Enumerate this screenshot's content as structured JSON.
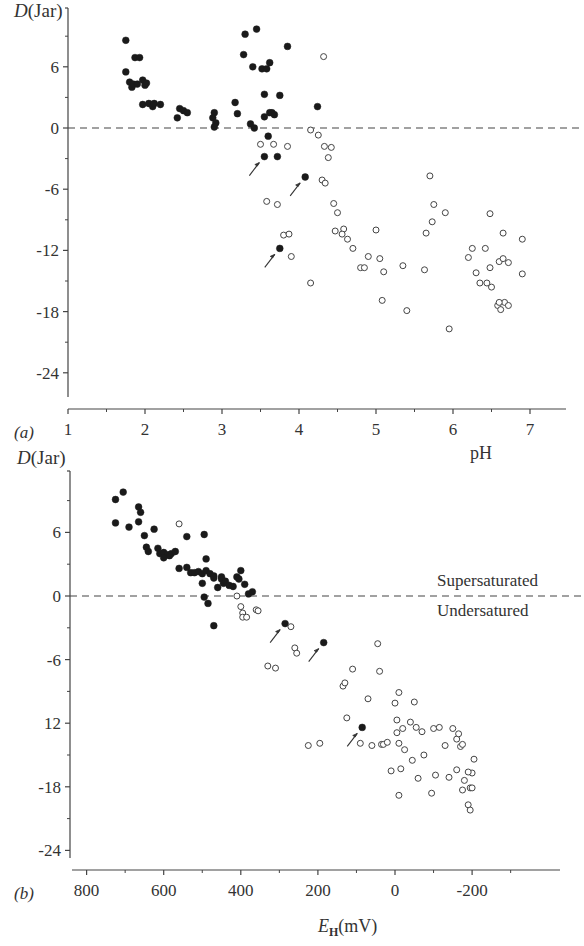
{
  "figure": {
    "panels": [
      {
        "id": "a",
        "panel_label": "(a)",
        "y_label_italic": "D",
        "y_label_rest": "(Jar)",
        "x_label": "pH",
        "y_tick_labels": [
          "6",
          "0",
          "-6",
          "-12",
          "-18",
          "-24"
        ],
        "x_tick_labels": [
          "1",
          "2",
          "3",
          "4",
          "5",
          "6",
          "7"
        ]
      },
      {
        "id": "b",
        "panel_label": "(b)",
        "y_label_italic": "D",
        "y_label_rest": "(Jar)",
        "x_label_italic": "E",
        "x_label_sub": "H",
        "x_label_rest": "(mV)",
        "y_tick_labels": [
          "6",
          "0",
          "-6",
          "12",
          "-18",
          "-24"
        ],
        "x_tick_labels": [
          "800",
          "600",
          "400",
          "200",
          "0",
          "-200"
        ],
        "annotation_above": "Supersaturated",
        "annotation_below": "Undersatured"
      }
    ]
  },
  "chart_data": [
    {
      "type": "scatter",
      "title": "",
      "panel": "(a)",
      "xlabel": "pH",
      "ylabel": "D (Jar)",
      "xlim": [
        1,
        7.5
      ],
      "ylim": [
        -27,
        10
      ],
      "xticks": [
        1,
        2,
        3,
        4,
        5,
        6,
        7
      ],
      "yticks": [
        6,
        0,
        -6,
        -12,
        -18,
        -24
      ],
      "reference_line": {
        "y": 0,
        "style": "dashed"
      },
      "grid": false,
      "series": [
        {
          "name": "filled",
          "marker": "filled-circle",
          "points": [
            [
              1.75,
              8.6
            ],
            [
              1.75,
              5.5
            ],
            [
              1.8,
              4.5
            ],
            [
              1.83,
              4.0
            ],
            [
              1.87,
              6.9
            ],
            [
              1.93,
              6.9
            ],
            [
              1.85,
              4.3
            ],
            [
              1.9,
              4.3
            ],
            [
              1.97,
              4.7
            ],
            [
              2.0,
              4.2
            ],
            [
              2.02,
              4.4
            ],
            [
              1.97,
              2.3
            ],
            [
              2.05,
              2.4
            ],
            [
              2.1,
              2.1
            ],
            [
              2.12,
              2.4
            ],
            [
              2.2,
              2.3
            ],
            [
              2.45,
              1.9
            ],
            [
              2.5,
              1.7
            ],
            [
              2.55,
              1.5
            ],
            [
              2.42,
              1.0
            ],
            [
              2.9,
              1.5
            ],
            [
              2.88,
              1.0
            ],
            [
              2.92,
              0.5
            ],
            [
              2.9,
              0.1
            ],
            [
              3.17,
              2.5
            ],
            [
              3.2,
              1.4
            ],
            [
              3.28,
              7.2
            ],
            [
              3.3,
              9.2
            ],
            [
              3.45,
              9.7
            ],
            [
              3.4,
              6.0
            ],
            [
              3.52,
              5.8
            ],
            [
              3.58,
              5.8
            ],
            [
              3.62,
              1.5
            ],
            [
              3.55,
              3.3
            ],
            [
              3.55,
              1.1
            ],
            [
              3.65,
              1.5
            ],
            [
              3.68,
              1.3
            ],
            [
              3.62,
              6.4
            ],
            [
              3.75,
              3.2
            ],
            [
              3.85,
              8.0
            ],
            [
              3.37,
              0.4
            ],
            [
              3.42,
              0.0
            ],
            [
              3.6,
              -0.8
            ],
            [
              3.55,
              -2.8
            ],
            [
              3.72,
              -2.8
            ],
            [
              4.24,
              2.1
            ],
            [
              4.08,
              -4.8
            ],
            [
              3.75,
              -11.8
            ]
          ]
        },
        {
          "name": "open",
          "marker": "open-circle",
          "points": [
            [
              3.5,
              -1.6
            ],
            [
              3.67,
              -1.6
            ],
            [
              3.85,
              -1.8
            ],
            [
              4.32,
              7.0
            ],
            [
              4.15,
              -0.2
            ],
            [
              4.25,
              -0.7
            ],
            [
              4.33,
              -1.8
            ],
            [
              4.42,
              -1.9
            ],
            [
              4.38,
              -2.9
            ],
            [
              4.3,
              -5.1
            ],
            [
              4.34,
              -5.4
            ],
            [
              3.58,
              -7.2
            ],
            [
              3.72,
              -7.5
            ],
            [
              3.8,
              -10.5
            ],
            [
              3.87,
              -10.4
            ],
            [
              3.9,
              -12.6
            ],
            [
              4.15,
              -15.2
            ],
            [
              4.45,
              -7.4
            ],
            [
              4.5,
              -8.3
            ],
            [
              4.58,
              -9.9
            ],
            [
              4.47,
              -10.1
            ],
            [
              4.56,
              -10.4
            ],
            [
              4.63,
              -10.9
            ],
            [
              4.7,
              -11.8
            ],
            [
              4.8,
              -13.7
            ],
            [
              4.85,
              -13.7
            ],
            [
              4.9,
              -12.6
            ],
            [
              5.0,
              -10.0
            ],
            [
              5.05,
              -12.8
            ],
            [
              5.1,
              -14.1
            ],
            [
              5.08,
              -16.9
            ],
            [
              5.35,
              -13.5
            ],
            [
              5.4,
              -17.9
            ],
            [
              5.65,
              -10.3
            ],
            [
              5.7,
              -4.7
            ],
            [
              5.75,
              -7.5
            ],
            [
              5.73,
              -9.2
            ],
            [
              5.9,
              -8.3
            ],
            [
              5.63,
              -13.9
            ],
            [
              5.95,
              -19.7
            ],
            [
              6.2,
              -12.7
            ],
            [
              6.25,
              -11.8
            ],
            [
              6.3,
              -14.2
            ],
            [
              6.35,
              -15.2
            ],
            [
              6.42,
              -11.8
            ],
            [
              6.44,
              -15.2
            ],
            [
              6.48,
              -13.7
            ],
            [
              6.48,
              -8.4
            ],
            [
              6.5,
              -15.6
            ],
            [
              6.58,
              -17.4
            ],
            [
              6.6,
              -13.1
            ],
            [
              6.65,
              -12.8
            ],
            [
              6.62,
              -17.8
            ],
            [
              6.67,
              -17.1
            ],
            [
              6.72,
              -13.2
            ],
            [
              6.72,
              -17.4
            ],
            [
              6.65,
              -10.3
            ],
            [
              6.9,
              -10.9
            ],
            [
              6.9,
              -14.3
            ],
            [
              6.6,
              -17.1
            ]
          ]
        }
      ],
      "annotations": [
        {
          "type": "arrow",
          "points_to": [
            3.55,
            -2.8
          ]
        },
        {
          "type": "arrow",
          "points_to": [
            4.08,
            -4.8
          ]
        },
        {
          "type": "arrow",
          "points_to": [
            3.75,
            -11.8
          ]
        }
      ]
    },
    {
      "type": "scatter",
      "title": "",
      "panel": "(b)",
      "xlabel": "E_H (mV)",
      "ylabel": "D (Jar)",
      "xlim": [
        830,
        -400
      ],
      "x_axis_reversed": true,
      "ylim": [
        -27,
        10
      ],
      "xticks": [
        800,
        600,
        400,
        200,
        0,
        -200
      ],
      "yticks": [
        6,
        0,
        -6,
        -12,
        -18,
        -24
      ],
      "ytick_labels_as_printed": [
        "6",
        "0",
        "-6",
        "12",
        "-18",
        "-24"
      ],
      "reference_line": {
        "y": 0,
        "style": "dashed",
        "label_above": "Supersaturated",
        "label_below": "Undersatured"
      },
      "grid": false,
      "series": [
        {
          "name": "filled",
          "marker": "filled-circle",
          "points": [
            [
              725,
              9.1
            ],
            [
              705,
              9.8
            ],
            [
              725,
              6.9
            ],
            [
              690,
              6.5
            ],
            [
              665,
              8.4
            ],
            [
              660,
              7.9
            ],
            [
              665,
              7.0
            ],
            [
              650,
              5.7
            ],
            [
              625,
              6.3
            ],
            [
              645,
              4.6
            ],
            [
              640,
              4.2
            ],
            [
              615,
              4.5
            ],
            [
              610,
              4.0
            ],
            [
              600,
              4.1
            ],
            [
              590,
              3.9
            ],
            [
              585,
              3.8
            ],
            [
              580,
              4.0
            ],
            [
              600,
              3.6
            ],
            [
              570,
              4.2
            ],
            [
              560,
              2.6
            ],
            [
              540,
              2.7
            ],
            [
              540,
              5.6
            ],
            [
              530,
              2.2
            ],
            [
              520,
              2.2
            ],
            [
              510,
              2.3
            ],
            [
              500,
              2.1
            ],
            [
              490,
              2.4
            ],
            [
              480,
              2.1
            ],
            [
              470,
              1.9
            ],
            [
              450,
              1.8
            ],
            [
              445,
              1.2
            ],
            [
              500,
              1.2
            ],
            [
              495,
              5.8
            ],
            [
              490,
              3.5
            ],
            [
              470,
              1.7
            ],
            [
              460,
              0.8
            ],
            [
              450,
              1.6
            ],
            [
              440,
              1.4
            ],
            [
              430,
              1.0
            ],
            [
              420,
              0.9
            ],
            [
              410,
              1.8
            ],
            [
              405,
              1.6
            ],
            [
              400,
              2.4
            ],
            [
              390,
              1.1
            ],
            [
              380,
              0.2
            ],
            [
              370,
              0.4
            ],
            [
              495,
              -0.1
            ],
            [
              485,
              -0.7
            ],
            [
              470,
              -2.8
            ],
            [
              285,
              -2.6
            ],
            [
              185,
              -4.4
            ],
            [
              85,
              -12.4
            ]
          ]
        },
        {
          "name": "open",
          "marker": "open-circle",
          "points": [
            [
              560,
              6.8
            ],
            [
              410,
              0.0
            ],
            [
              400,
              -1.0
            ],
            [
              395,
              -1.6
            ],
            [
              395,
              -2.0
            ],
            [
              385,
              -2.0
            ],
            [
              360,
              -1.3
            ],
            [
              355,
              -1.4
            ],
            [
              330,
              -6.6
            ],
            [
              310,
              -6.8
            ],
            [
              270,
              -2.9
            ],
            [
              260,
              -4.9
            ],
            [
              255,
              -5.4
            ],
            [
              225,
              -14.1
            ],
            [
              195,
              -13.9
            ],
            [
              135,
              -8.5
            ],
            [
              130,
              -8.2
            ],
            [
              125,
              -11.5
            ],
            [
              110,
              -6.9
            ],
            [
              90,
              -13.9
            ],
            [
              70,
              -9.7
            ],
            [
              60,
              -14.1
            ],
            [
              45,
              -4.5
            ],
            [
              40,
              -7.1
            ],
            [
              35,
              -14.0
            ],
            [
              30,
              -14.0
            ],
            [
              20,
              -13.8
            ],
            [
              10,
              -16.5
            ],
            [
              0,
              -10.1
            ],
            [
              -5,
              -11.7
            ],
            [
              -10,
              -9.1
            ],
            [
              -5,
              -12.9
            ],
            [
              -10,
              -13.9
            ],
            [
              -15,
              -16.3
            ],
            [
              -20,
              -12.5
            ],
            [
              -25,
              -14.5
            ],
            [
              -40,
              -11.9
            ],
            [
              -45,
              -15.5
            ],
            [
              -50,
              -10.0
            ],
            [
              -55,
              -12.4
            ],
            [
              -60,
              -17.2
            ],
            [
              -70,
              -12.8
            ],
            [
              -75,
              -15.0
            ],
            [
              -95,
              -18.6
            ],
            [
              -100,
              -12.5
            ],
            [
              -105,
              -16.9
            ],
            [
              -115,
              -12.4
            ],
            [
              -130,
              -14.1
            ],
            [
              -140,
              -17.1
            ],
            [
              -150,
              -12.5
            ],
            [
              -160,
              -13.5
            ],
            [
              -165,
              -13.0
            ],
            [
              -170,
              -14.2
            ],
            [
              -175,
              -14.0
            ],
            [
              -160,
              -16.4
            ],
            [
              -175,
              -18.3
            ],
            [
              -180,
              -17.4
            ],
            [
              -190,
              -19.7
            ],
            [
              -195,
              -18.1
            ],
            [
              -195,
              -20.2
            ],
            [
              -200,
              -18.1
            ],
            [
              -200,
              -16.7
            ],
            [
              -190,
              -16.6
            ],
            [
              -205,
              -15.4
            ],
            [
              -10,
              -18.8
            ]
          ]
        }
      ],
      "annotations": [
        {
          "type": "arrow",
          "points_to": [
            285,
            -2.6
          ]
        },
        {
          "type": "arrow",
          "points_to": [
            185,
            -4.4
          ]
        },
        {
          "type": "arrow",
          "points_to": [
            85,
            -12.4
          ]
        }
      ]
    }
  ]
}
